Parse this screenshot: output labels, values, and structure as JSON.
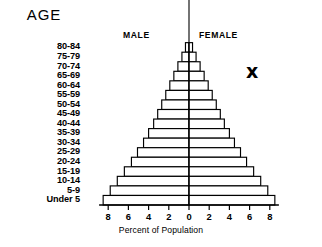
{
  "chart_data": {
    "type": "bar",
    "title": "",
    "subtitle": "",
    "orientation": "horizontal-pyramid",
    "xlabel": "Percent of Population",
    "ylabel": "AGE",
    "xlim": [
      -9,
      9
    ],
    "xticks": [
      8,
      6,
      4,
      2,
      0,
      2,
      4,
      6,
      8
    ],
    "grid": false,
    "legend_position": "top-inside",
    "categories": [
      "80-84",
      "75-79",
      "70-74",
      "65-69",
      "60-64",
      "55-59",
      "50-54",
      "45-49",
      "40-44",
      "35-39",
      "30-34",
      "25-29",
      "20-24",
      "15-19",
      "10-14",
      "5-9",
      "Under 5"
    ],
    "series": [
      {
        "name": "MALE",
        "side": "left",
        "values": [
          0.35,
          0.7,
          1.1,
          1.5,
          1.9,
          2.3,
          2.7,
          3.1,
          3.5,
          4.0,
          4.5,
          5.1,
          5.7,
          6.4,
          7.1,
          7.8,
          8.5
        ]
      },
      {
        "name": "FEMALE",
        "side": "right",
        "values": [
          0.35,
          0.7,
          1.1,
          1.5,
          1.9,
          2.3,
          2.7,
          3.1,
          3.5,
          4.0,
          4.5,
          5.1,
          5.7,
          6.4,
          7.1,
          7.8,
          8.5
        ]
      }
    ],
    "annotations": [
      {
        "text": "x",
        "x": 6.0,
        "y_category": "60-64",
        "style": "bold-marker"
      }
    ]
  },
  "labels": {
    "age_heading": "AGE",
    "male": "MALE",
    "female": "FEMALE",
    "axis_title": "Percent of Population",
    "annotation_marker": "x"
  }
}
